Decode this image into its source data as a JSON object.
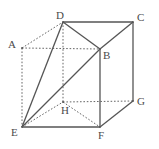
{
  "figure": {
    "width": 159,
    "height": 149,
    "background_color": "#ffffff",
    "line_color": "#555555",
    "dashed_line_color": "#666666",
    "label_color": "#4a4a4a",
    "label_font_size": 11
  },
  "vertices": [
    {
      "id": "A",
      "label": "A",
      "x": 22,
      "y": 48,
      "label_x": 8,
      "label_y": 39,
      "hidden": true
    },
    {
      "id": "B",
      "label": "B",
      "x": 100,
      "y": 49,
      "label_x": 103,
      "label_y": 50,
      "hidden": false
    },
    {
      "id": "C",
      "label": "C",
      "x": 133,
      "y": 22,
      "label_x": 137,
      "label_y": 12,
      "hidden": false
    },
    {
      "id": "D",
      "label": "D",
      "x": 63,
      "y": 22,
      "label_x": 56,
      "label_y": 10,
      "hidden": false
    },
    {
      "id": "E",
      "label": "E",
      "x": 22,
      "y": 127,
      "label_x": 11,
      "label_y": 127,
      "hidden": false
    },
    {
      "id": "F",
      "label": "F",
      "x": 100,
      "y": 127,
      "label_x": 98,
      "label_y": 130,
      "hidden": false
    },
    {
      "id": "G",
      "label": "G",
      "x": 133,
      "y": 101,
      "label_x": 137,
      "label_y": 96,
      "hidden": false
    },
    {
      "id": "H",
      "label": "H",
      "x": 63,
      "y": 102,
      "label_x": 61,
      "label_y": 105,
      "hidden": true
    }
  ],
  "edges": [
    {
      "from": "D",
      "to": "C",
      "style": "solid",
      "kind": "cube-edge"
    },
    {
      "from": "D",
      "to": "B",
      "style": "solid",
      "kind": "cube-edge"
    },
    {
      "from": "B",
      "to": "C",
      "style": "solid",
      "kind": "cube-edge"
    },
    {
      "from": "B",
      "to": "F",
      "style": "solid",
      "kind": "cube-edge"
    },
    {
      "from": "C",
      "to": "G",
      "style": "solid",
      "kind": "cube-edge"
    },
    {
      "from": "E",
      "to": "F",
      "style": "solid",
      "kind": "cube-edge"
    },
    {
      "from": "F",
      "to": "G",
      "style": "solid",
      "kind": "cube-edge"
    },
    {
      "from": "A",
      "to": "D",
      "style": "dashed",
      "kind": "cube-edge"
    },
    {
      "from": "A",
      "to": "B",
      "style": "dashed",
      "kind": "cube-edge"
    },
    {
      "from": "A",
      "to": "E",
      "style": "dashed",
      "kind": "cube-edge"
    },
    {
      "from": "D",
      "to": "H",
      "style": "dashed",
      "kind": "cube-edge"
    },
    {
      "from": "H",
      "to": "F",
      "style": "dashed",
      "kind": "cube-edge"
    },
    {
      "from": "H",
      "to": "G",
      "style": "dashed",
      "kind": "cube-edge"
    },
    {
      "from": "E",
      "to": "D",
      "style": "solid",
      "kind": "diagonal"
    },
    {
      "from": "E",
      "to": "B",
      "style": "solid",
      "kind": "diagonal"
    },
    {
      "from": "E",
      "to": "H",
      "style": "dashed",
      "kind": "diagonal"
    }
  ]
}
